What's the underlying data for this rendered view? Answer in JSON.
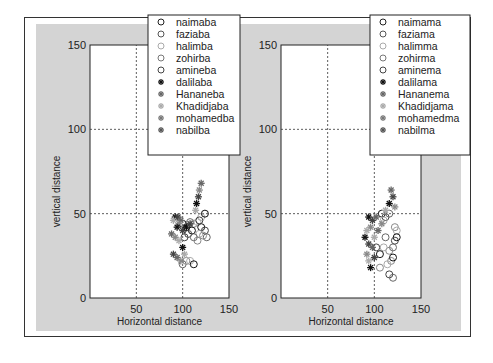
{
  "chart_data": [
    {
      "type": "scatter",
      "title": "",
      "xlabel": "Horizontal distance",
      "ylabel": "vertical distance",
      "xlim": [
        0,
        150
      ],
      "ylim": [
        0,
        150
      ],
      "xticks": [
        0,
        50,
        100,
        150
      ],
      "xtick_labels": [
        "",
        "50",
        "100",
        "150"
      ],
      "yticks": [
        0,
        50,
        100,
        150
      ],
      "ytick_labels": [
        "0",
        "50",
        "100",
        "150"
      ],
      "grid": true,
      "legend_position": "upper right",
      "legend": [
        {
          "name": "naimaba",
          "marker": "o",
          "color": "#222222"
        },
        {
          "name": "faziaba",
          "marker": "o",
          "color": "#555555"
        },
        {
          "name": "halimba",
          "marker": "o",
          "color": "#aaaaaa"
        },
        {
          "name": "zohirba",
          "marker": "o",
          "color": "#777777"
        },
        {
          "name": "amineba",
          "marker": "o",
          "color": "#444444"
        },
        {
          "name": "dalilaba",
          "marker": "*",
          "color": "#111111"
        },
        {
          "name": "Hananeba",
          "marker": "*",
          "color": "#666666"
        },
        {
          "name": "Khadidjaba",
          "marker": "*",
          "color": "#aaaaaa"
        },
        {
          "name": "mohamedba",
          "marker": "*",
          "color": "#777777"
        },
        {
          "name": "nabilba",
          "marker": "*",
          "color": "#555555"
        }
      ],
      "series": [
        {
          "name": "circles",
          "marker": "o",
          "points": [
            [
              100,
              44
            ],
            [
              104,
              42
            ],
            [
              108,
              45
            ],
            [
              112,
              44
            ],
            [
              116,
              45
            ],
            [
              120,
              42
            ],
            [
              124,
              40
            ],
            [
              126,
              36
            ],
            [
              122,
              37
            ],
            [
              118,
              38
            ],
            [
              110,
              40
            ],
            [
              106,
              38
            ],
            [
              112,
              36
            ],
            [
              116,
              34
            ],
            [
              120,
              48
            ],
            [
              124,
              50
            ],
            [
              118,
              46
            ],
            [
              100,
              20
            ],
            [
              104,
              22
            ],
            [
              108,
              22
            ],
            [
              112,
              20
            ],
            [
              102,
              36
            ]
          ]
        },
        {
          "name": "stars",
          "marker": "*",
          "points": [
            [
              92,
              48
            ],
            [
              95,
              48
            ],
            [
              98,
              46
            ],
            [
              96,
              44
            ],
            [
              90,
              46
            ],
            [
              94,
              42
            ],
            [
              100,
              40
            ],
            [
              88,
              38
            ],
            [
              92,
              36
            ],
            [
              96,
              34
            ],
            [
              100,
              30
            ],
            [
              90,
              26
            ],
            [
              94,
              24
            ],
            [
              98,
              22
            ],
            [
              102,
              26
            ],
            [
              115,
              56
            ],
            [
              117,
              60
            ],
            [
              120,
              68
            ],
            [
              118,
              64
            ],
            [
              114,
              52
            ],
            [
              104,
              42
            ],
            [
              108,
              44
            ]
          ]
        }
      ]
    },
    {
      "type": "scatter",
      "title": "",
      "xlabel": "Horizontal distance",
      "ylabel": "vertical distance",
      "xlim": [
        0,
        150
      ],
      "ylim": [
        0,
        150
      ],
      "xticks": [
        0,
        50,
        100,
        150
      ],
      "xtick_labels": [
        "",
        "50",
        "100",
        "150"
      ],
      "yticks": [
        0,
        50,
        100,
        150
      ],
      "ytick_labels": [
        "0",
        "50",
        "100",
        "150"
      ],
      "grid": true,
      "legend_position": "upper right",
      "legend": [
        {
          "name": "naimama",
          "marker": "o",
          "color": "#222222"
        },
        {
          "name": "faziama",
          "marker": "o",
          "color": "#555555"
        },
        {
          "name": "halimma",
          "marker": "o",
          "color": "#aaaaaa"
        },
        {
          "name": "zohirma",
          "marker": "o",
          "color": "#777777"
        },
        {
          "name": "aminema",
          "marker": "o",
          "color": "#444444"
        },
        {
          "name": "dalilama",
          "marker": "*",
          "color": "#111111"
        },
        {
          "name": "Hananema",
          "marker": "*",
          "color": "#666666"
        },
        {
          "name": "Khadidjama",
          "marker": "*",
          "color": "#aaaaaa"
        },
        {
          "name": "mohamedma",
          "marker": "*",
          "color": "#777777"
        },
        {
          "name": "nabilma",
          "marker": "*",
          "color": "#555555"
        }
      ],
      "series": [
        {
          "name": "circles",
          "marker": "o",
          "points": [
            [
              108,
              50
            ],
            [
              112,
              48
            ],
            [
              116,
              50
            ],
            [
              122,
              42
            ],
            [
              124,
              40
            ],
            [
              124,
              36
            ],
            [
              122,
              34
            ],
            [
              120,
              30
            ],
            [
              116,
              28
            ],
            [
              110,
              30
            ],
            [
              106,
              26
            ],
            [
              102,
              30
            ],
            [
              112,
              36
            ],
            [
              118,
              22
            ],
            [
              114,
              20
            ],
            [
              120,
              24
            ],
            [
              116,
              14
            ],
            [
              120,
              12
            ],
            [
              106,
              18
            ],
            [
              110,
              46
            ]
          ]
        },
        {
          "name": "stars",
          "marker": "*",
          "points": [
            [
              94,
              48
            ],
            [
              98,
              46
            ],
            [
              102,
              48
            ],
            [
              96,
              42
            ],
            [
              92,
              40
            ],
            [
              90,
              36
            ],
            [
              94,
              32
            ],
            [
              98,
              30
            ],
            [
              92,
              26
            ],
            [
              94,
              22
            ],
            [
              96,
              18
            ],
            [
              100,
              24
            ],
            [
              104,
              40
            ],
            [
              108,
              44
            ],
            [
              112,
              52
            ],
            [
              116,
              56
            ],
            [
              120,
              60
            ],
            [
              118,
              64
            ],
            [
              122,
              54
            ],
            [
              100,
              36
            ]
          ]
        }
      ]
    }
  ]
}
